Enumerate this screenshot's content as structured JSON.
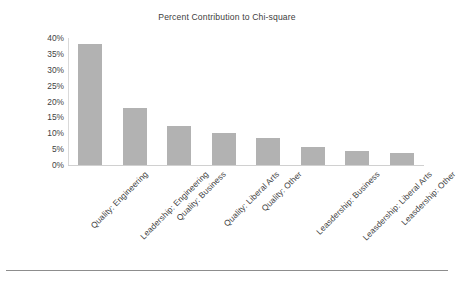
{
  "chart_data": {
    "type": "bar",
    "title": "Percent Contribution to Chi-square",
    "xlabel": "",
    "ylabel": "",
    "categories": [
      "Quality: Engineering",
      "Leadership: Engineering",
      "Quality: Business",
      "Quality: Liberal Arts",
      "Quality: Other",
      "Leasdership: Business",
      "Leasdership: Liberal Arts",
      "Leasdership: Other"
    ],
    "values": [
      38,
      18,
      12.3,
      10,
      8.4,
      5.8,
      4.5,
      3.9
    ],
    "ylim": [
      0,
      40
    ],
    "ytick_labels": [
      "40%",
      "35%",
      "30%",
      "25%",
      "20%",
      "15%",
      "10%",
      "5%",
      "0%"
    ],
    "ytick_values": [
      40,
      35,
      30,
      25,
      20,
      15,
      10,
      5,
      0
    ],
    "grid": false,
    "legend": "none",
    "bar_color": "#b2b2b2",
    "axis_color": "#d0d0d0",
    "text_color": "#3f3f3f"
  }
}
